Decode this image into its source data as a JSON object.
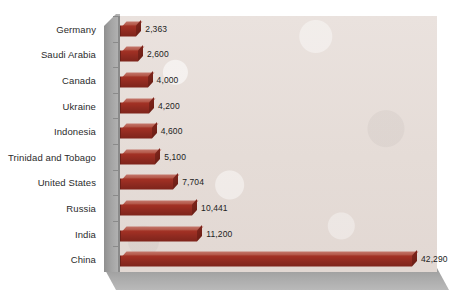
{
  "chart_data": {
    "type": "bar",
    "orientation": "horizontal",
    "title": "",
    "subtitle": "",
    "xlabel": "",
    "ylabel": "",
    "grid": false,
    "legend": false,
    "legend_position": "none",
    "xlim": [
      0,
      45000
    ],
    "categories": [
      "Germany",
      "Saudi Arabia",
      "Canada",
      "Ukraine",
      "Indonesia",
      "Trinidad and Tobago",
      "United States",
      "Russia",
      "India",
      "China"
    ],
    "values": [
      2363,
      2600,
      4000,
      4200,
      4600,
      5100,
      7704,
      10441,
      11200,
      42290
    ],
    "value_labels": [
      "2,363",
      "2,600",
      "4,000",
      "4,200",
      "4,600",
      "5,100",
      "7,704",
      "10,441",
      "11,200",
      "42,290"
    ],
    "tick_labels": [],
    "series": [
      {
        "name": "",
        "values": [
          2363,
          2600,
          4000,
          4200,
          4600,
          5100,
          7704,
          10441,
          11200,
          42290
        ]
      }
    ]
  },
  "style": {
    "bar_color": "#8e2a20",
    "bar_highlight": "#b55a4c",
    "bar_shadow": "#6d1f16",
    "plot_background": "#e7ded9",
    "wall_color": "#a4a4a4",
    "floor_color": "#a9a9a9",
    "axis_color": "#8a8a8a",
    "label_color": "#2b2b2b",
    "page_background": "#ffffff"
  }
}
